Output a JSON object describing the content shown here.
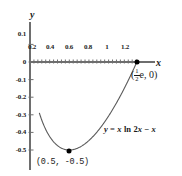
{
  "chart_data": {
    "type": "line",
    "title": "",
    "xlabel": "x",
    "ylabel": "y",
    "xlim": [
      0,
      1.45
    ],
    "ylim": [
      -0.55,
      0.12
    ],
    "grid": false,
    "legend": "none",
    "equation_label": "y = x ln 2x − x",
    "equation_parts": {
      "y": "y",
      "equals": "=",
      "x1": "x",
      "ln": "ln",
      "two": "2",
      "x2": "x",
      "minus": "−",
      "x3": "x"
    },
    "xticks": [
      0.2,
      0.4,
      0.6,
      0.8,
      1,
      1.2
    ],
    "xtick_labels": [
      "0.2",
      "0.4",
      "0.6",
      "0.8",
      "1",
      "1.2"
    ],
    "yticks": [
      0.1,
      0,
      -0.1,
      -0.2,
      -0.3,
      -0.4,
      -0.5
    ],
    "ytick_labels": [
      "0.1",
      "0",
      "-0.1",
      "-0.2",
      "-0.3",
      "-0.4",
      "-0.5"
    ],
    "series": [
      {
        "name": "y = x ln 2x - x",
        "x": [
          0.12,
          0.15,
          0.2,
          0.25,
          0.3,
          0.35,
          0.4,
          0.45,
          0.5,
          0.55,
          0.6,
          0.7,
          0.8,
          0.9,
          1.0,
          1.1,
          1.2,
          1.3,
          1.359
        ],
        "y": [
          -0.4,
          -0.45,
          -0.4966,
          -0.5253,
          -0.5466,
          -0.5602,
          -0.5695,
          -0.5737,
          -0.5746,
          -0.5726,
          -0.5682,
          -0.5527,
          -0.5301,
          -0.5016,
          -0.4681,
          -0.4301,
          -0.3881,
          -0.3425,
          -0.3031
        ]
      }
    ],
    "points": [
      {
        "id": "minimum",
        "x": 0.5,
        "y": -0.5,
        "label": "(0.5, -0.5)",
        "marker": "filled-circle"
      },
      {
        "id": "x-intercept",
        "x": 1.3591,
        "y": 0,
        "label_numerator": "1",
        "label_denominator": "2",
        "label_prefix": "(",
        "label_suffix": "e, 0)",
        "marker": "filled-circle"
      }
    ],
    "colors": {
      "curve": "#5a5a5a",
      "axis": "#6e6e6e",
      "marker": "#000000",
      "text": "#1a1a1a",
      "background": "#ffffff"
    }
  }
}
